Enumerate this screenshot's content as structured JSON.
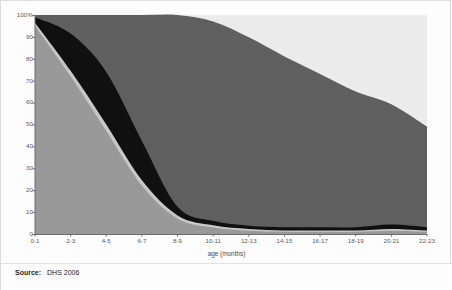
{
  "figure": {
    "background": "#ffffff",
    "border_color": "#dcdcdc"
  },
  "footer": {
    "source_label": "Source:",
    "source_value": "DHS 2006"
  },
  "chart_data": {
    "type": "area",
    "stacked": true,
    "normalized_percent": true,
    "title": "",
    "subtitle": "",
    "xlabel": "age (months)",
    "ylabel": "",
    "grid": false,
    "legend_position": "none",
    "ylim": [
      0,
      100
    ],
    "ytick_labels": [
      "100%",
      "90",
      "80",
      "70",
      "60",
      "50",
      "40",
      "30",
      "20",
      "10",
      "0"
    ],
    "ytick_values": [
      100,
      90,
      80,
      70,
      60,
      50,
      40,
      30,
      20,
      10,
      0
    ],
    "categories": [
      "0-1",
      "2-3",
      "4-5",
      "6-7",
      "8-9",
      "10-11",
      "12-13",
      "14-15",
      "16-17",
      "18-19",
      "20-21",
      "22-23"
    ],
    "x_index": [
      0,
      1,
      2,
      3,
      4,
      5,
      6,
      7,
      8,
      9,
      10,
      11
    ],
    "series": [
      {
        "name": "exclusively breastfed",
        "color": "#9a9a9a",
        "order": 1,
        "values": [
          95,
          72,
          47,
          22,
          7,
          3,
          1.5,
          1,
          1,
          1,
          1.5,
          1
        ]
      },
      {
        "name": "breastfed and plain water only",
        "color": "#c9c9c9",
        "order": 2,
        "values": [
          1.5,
          2.5,
          3,
          2.5,
          1.5,
          1,
          0.8,
          0.6,
          0.6,
          0.6,
          0.8,
          0.6
        ]
      },
      {
        "name": "breastfed and non-milk liquids",
        "color": "#101010",
        "order": 3,
        "values": [
          2.5,
          17,
          24,
          18,
          4,
          2,
          1.5,
          1.5,
          1.5,
          1.5,
          2,
          1.5
        ]
      },
      {
        "name": "breastfed and complementary foods",
        "color": "#606060",
        "order": 4,
        "values": [
          1,
          8.5,
          26,
          57.5,
          87.5,
          91,
          86,
          78,
          70,
          62,
          55,
          46
        ]
      },
      {
        "name": "not breastfed",
        "color": "#eeeeee",
        "order": 5,
        "values": [
          0,
          0,
          0,
          0,
          0,
          3,
          10.2,
          18.9,
          26.9,
          34.9,
          40.7,
          50.9
        ]
      }
    ]
  },
  "plot_geometry": {
    "left": 34,
    "right": 426,
    "top": 14,
    "bottom": 233,
    "axis_color": "#6e6e6e"
  }
}
